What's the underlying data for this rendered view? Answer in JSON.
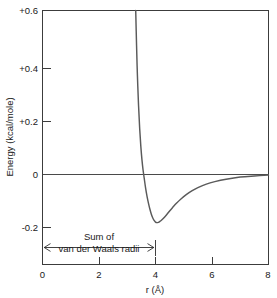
{
  "chart_data": {
    "type": "line",
    "title": "",
    "xlabel": "r (Å)",
    "ylabel": "Energy (kcal/mole)",
    "xlim": [
      0,
      8
    ],
    "ylim": [
      -0.28,
      0.6
    ],
    "xticks": [
      "0",
      "2",
      "4",
      "6",
      "8"
    ],
    "xtick_values": [
      0,
      2,
      4,
      6,
      8
    ],
    "yticks": [
      "+0.6",
      "+0.4",
      "+0.2",
      "0",
      "-0.2"
    ],
    "ytick_values": [
      0.6,
      0.4,
      0.2,
      0,
      -0.2
    ],
    "grid": false,
    "legend": false,
    "series": [
      {
        "name": "van der Waals potential",
        "color": "#5a5a5a",
        "x": [
          3.3,
          3.33,
          3.36,
          3.4,
          3.44,
          3.48,
          3.52,
          3.56,
          3.6,
          3.65,
          3.7,
          3.75,
          3.8,
          3.85,
          3.9,
          3.95,
          4.0,
          4.05,
          4.1,
          4.15,
          4.2,
          4.3,
          4.4,
          4.5,
          4.6,
          4.75,
          4.9,
          5.1,
          5.3,
          5.5,
          5.8,
          6.1,
          6.5,
          7.0,
          7.5,
          8.0
        ],
        "y": [
          0.6,
          0.47,
          0.36,
          0.25,
          0.165,
          0.1,
          0.05,
          0.012,
          -0.018,
          -0.055,
          -0.085,
          -0.11,
          -0.132,
          -0.15,
          -0.164,
          -0.174,
          -0.18,
          -0.182,
          -0.181,
          -0.178,
          -0.174,
          -0.164,
          -0.152,
          -0.139,
          -0.127,
          -0.11,
          -0.095,
          -0.078,
          -0.064,
          -0.053,
          -0.04,
          -0.031,
          -0.022,
          -0.014,
          -0.01,
          -0.007
        ]
      }
    ],
    "zero_reference_line": 0,
    "annotations": [
      {
        "name": "van-der-Waals-radii-span",
        "text_line1": "Sum of",
        "text_line2": "van der Waals radii",
        "x_start": 0,
        "x_end": 4.0,
        "arrow_style": "double-headed"
      }
    ],
    "features": {
      "minimum_r": 4.0,
      "minimum_energy": -0.18,
      "zero_crossing_r": 3.55
    }
  }
}
